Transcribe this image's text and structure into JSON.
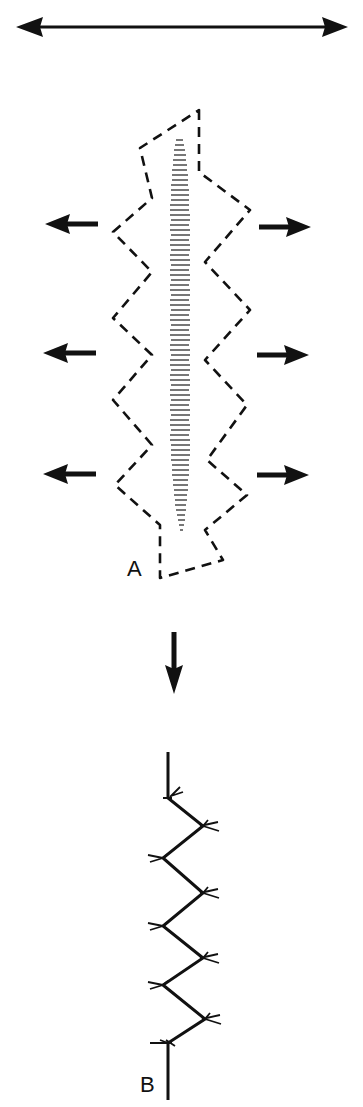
{
  "figure": {
    "labels": {
      "a": "A",
      "b": "B"
    },
    "colors": {
      "ink": "#111111",
      "hatch": "#555555",
      "background": "#ffffff"
    },
    "tension_arrow": {
      "direction": "horizontal-bidirectional"
    },
    "lateral_arrows": {
      "left": [
        "left",
        "left",
        "left"
      ],
      "right": [
        "right",
        "right",
        "right"
      ]
    },
    "transition_arrow": {
      "direction": "down"
    },
    "panel_a": {
      "description": "dashed zigzag excision outline around hatched lesion"
    },
    "panel_b": {
      "description": "zigzag suture line with stitch marks"
    }
  }
}
